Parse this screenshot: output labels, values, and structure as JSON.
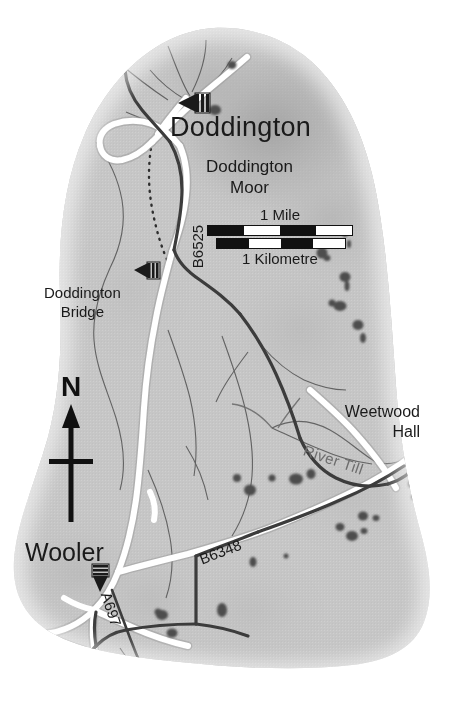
{
  "map": {
    "title": "Doddington Moor area map",
    "region": "Northumberland, England",
    "base_color": "#c6c6c6",
    "road_major_color": "#ffffff",
    "road_minor_color": "#4a4a4a",
    "water_color": "#6d6d6d",
    "tree_color": "#4d4d4d",
    "text_color": "#1a1a1a"
  },
  "places": {
    "doddington": "Doddington",
    "doddington_moor_line1": "Doddington",
    "doddington_moor_line2": "Moor",
    "doddington_bridge_line1": "Doddington",
    "doddington_bridge_line2": "Bridge",
    "weetwood_hall_line1": "Weetwood",
    "weetwood_hall_line2": "Hall",
    "wooler": "Wooler"
  },
  "water": {
    "river_till": "River Till"
  },
  "roads": {
    "b6525": "B6525",
    "b6348": "B6348",
    "a697": "A697"
  },
  "scale": {
    "mile_label": "1 Mile",
    "km_label": "1 Kilometre",
    "mile_segments": [
      "dark",
      "light",
      "dark",
      "light"
    ],
    "km_segments": [
      "dark",
      "light",
      "dark",
      "light"
    ]
  },
  "compass": {
    "north_letter": "N"
  },
  "markers": [
    {
      "name": "doddington-attraction-marker",
      "type": "attraction",
      "direction": "right"
    },
    {
      "name": "doddington-bridge-attraction-marker",
      "type": "attraction",
      "direction": "right"
    },
    {
      "name": "wooler-attraction-marker",
      "type": "attraction",
      "direction": "down"
    }
  ]
}
